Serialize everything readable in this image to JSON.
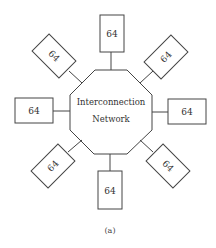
{
  "diagram": {
    "center": {
      "line1": "Interconnection",
      "line2": "Network"
    },
    "nodes": [
      {
        "position": "top",
        "label": "64"
      },
      {
        "position": "top-right",
        "label": "64"
      },
      {
        "position": "right",
        "label": "64"
      },
      {
        "position": "bottom-right",
        "label": "64"
      },
      {
        "position": "bottom",
        "label": "64"
      },
      {
        "position": "bottom-left",
        "label": "64"
      },
      {
        "position": "left",
        "label": "64"
      },
      {
        "position": "top-left",
        "label": "64"
      }
    ],
    "caption": "(a)",
    "colors": {
      "stroke": "#444444",
      "background": "#ffffff"
    }
  }
}
